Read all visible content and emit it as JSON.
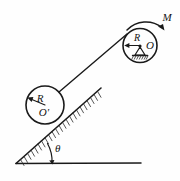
{
  "figure": {
    "background_color": "#fefefe",
    "ink_color": "#1a1a1a",
    "labels": {
      "pulley_radius": "R",
      "pulley_center": "O",
      "disc_radius": "R",
      "disc_center": "O'",
      "moment": "M",
      "incline_angle": "θ"
    },
    "elements": {
      "ground_line": "horizontal-ground",
      "incline_surface": "hatched-inclined-plane",
      "incline_hatching": "hatch-marks",
      "cord": "cord-line",
      "disc": "rolling-disc",
      "pulley": "fixed-pulley",
      "pin_support": "pin-support-triangle",
      "support_hatching": "support-ground-hatching",
      "moment_arrow": "clockwise-moment-arc",
      "angle_arc": "angle-arc",
      "disc_radius_arrow": "radius-arrow-disc",
      "pulley_radius_arrow": "radius-arrow-pulley"
    },
    "geometry": {
      "incline_angle_degrees": 28,
      "disc_center_x": 45,
      "disc_center_y": 105,
      "disc_radius_px": 19,
      "pulley_center_x": 140,
      "pulley_center_y": 45,
      "pulley_radius_px": 17
    }
  }
}
